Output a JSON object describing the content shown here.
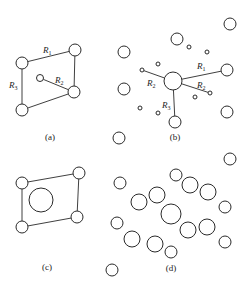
{
  "figure": {
    "width": 251,
    "height": 287,
    "stroke_color": "#2a2a2a",
    "background": "#ffffff"
  },
  "panels": {
    "a": {
      "caption": "(a)",
      "caption_pos": [
        50,
        140
      ],
      "nodes": [
        {
          "id": "a1",
          "x": 22,
          "y": 63,
          "r": 6
        },
        {
          "id": "a2",
          "x": 75,
          "y": 50,
          "r": 6
        },
        {
          "id": "a3",
          "x": 40,
          "y": 78,
          "r": 3.5
        },
        {
          "id": "a4",
          "x": 74,
          "y": 92,
          "r": 6
        },
        {
          "id": "a5",
          "x": 22,
          "y": 110,
          "r": 6
        }
      ],
      "edges": [
        [
          "a1",
          "a2"
        ],
        [
          "a2",
          "a4"
        ],
        [
          "a3",
          "a4"
        ],
        [
          "a4",
          "a5"
        ],
        [
          "a1",
          "a5"
        ]
      ],
      "labels": [
        {
          "text": "R",
          "sub": "1",
          "x": 43,
          "y": 53
        },
        {
          "text": "R",
          "sub": "2",
          "x": 55,
          "y": 83
        },
        {
          "text": "R",
          "sub": "3",
          "x": 9,
          "y": 88
        }
      ]
    },
    "b": {
      "caption": "(b)",
      "caption_pos": [
        175,
        140
      ],
      "center": {
        "id": "b0",
        "x": 173,
        "y": 81,
        "r": 9
      },
      "nodes": [
        {
          "id": "b1",
          "x": 230,
          "y": 24,
          "r": 6
        },
        {
          "id": "b2",
          "x": 177,
          "y": 39,
          "r": 6
        },
        {
          "id": "b3",
          "x": 189,
          "y": 47,
          "r": 2
        },
        {
          "id": "b4",
          "x": 207,
          "y": 52,
          "r": 2
        },
        {
          "id": "b5",
          "x": 124,
          "y": 52,
          "r": 6
        },
        {
          "id": "b6",
          "x": 158,
          "y": 64,
          "r": 2
        },
        {
          "id": "b7",
          "x": 142,
          "y": 70,
          "r": 2
        },
        {
          "id": "b8",
          "x": 227,
          "y": 70,
          "r": 6
        },
        {
          "id": "b9",
          "x": 210,
          "y": 93,
          "r": 2
        },
        {
          "id": "b10",
          "x": 195,
          "y": 97,
          "r": 2
        },
        {
          "id": "b11",
          "x": 124,
          "y": 89,
          "r": 6
        },
        {
          "id": "b12",
          "x": 140,
          "y": 108,
          "r": 2
        },
        {
          "id": "b13",
          "x": 158,
          "y": 113,
          "r": 2
        },
        {
          "id": "b14",
          "x": 175,
          "y": 122,
          "r": 6
        },
        {
          "id": "b15",
          "x": 227,
          "y": 112,
          "r": 6
        },
        {
          "id": "b16",
          "x": 119,
          "y": 138,
          "r": 6
        }
      ],
      "edges": [
        [
          "b0",
          "b7"
        ],
        [
          "b0",
          "b8"
        ],
        [
          "b0",
          "b9"
        ],
        [
          "b0",
          "b14"
        ]
      ],
      "labels": [
        {
          "text": "R",
          "sub": "1",
          "x": 197,
          "y": 69
        },
        {
          "text": "R",
          "sub": "2",
          "x": 197,
          "y": 88
        },
        {
          "text": "R",
          "sub": "2",
          "x": 147,
          "y": 86
        },
        {
          "text": "R",
          "sub": "3",
          "x": 162,
          "y": 108
        }
      ]
    },
    "c": {
      "caption": "(c)",
      "caption_pos": [
        47,
        270
      ],
      "nodes": [
        {
          "id": "c1",
          "x": 22,
          "y": 183,
          "r": 6
        },
        {
          "id": "c2",
          "x": 79,
          "y": 173,
          "r": 6
        },
        {
          "id": "c3",
          "x": 77,
          "y": 217,
          "r": 6
        },
        {
          "id": "c4",
          "x": 22,
          "y": 227,
          "r": 6
        },
        {
          "id": "c5",
          "x": 41,
          "y": 200,
          "r": 12
        }
      ],
      "edges": [
        [
          "c1",
          "c2"
        ],
        [
          "c2",
          "c3"
        ],
        [
          "c3",
          "c4"
        ],
        [
          "c4",
          "c1"
        ]
      ],
      "labels": []
    },
    "d": {
      "caption": "(d)",
      "caption_pos": [
        171,
        271
      ],
      "nodes": [
        {
          "id": "d1",
          "x": 230,
          "y": 159,
          "r": 6
        },
        {
          "id": "d2",
          "x": 176,
          "y": 175,
          "r": 6
        },
        {
          "id": "d3",
          "x": 120,
          "y": 183,
          "r": 6
        },
        {
          "id": "d4",
          "x": 190,
          "y": 185,
          "r": 8
        },
        {
          "id": "d5",
          "x": 208,
          "y": 192,
          "r": 8
        },
        {
          "id": "d6",
          "x": 157,
          "y": 195,
          "r": 8
        },
        {
          "id": "d7",
          "x": 139,
          "y": 202,
          "r": 8
        },
        {
          "id": "d8",
          "x": 225,
          "y": 207,
          "r": 6
        },
        {
          "id": "d9",
          "x": 171,
          "y": 214,
          "r": 10
        },
        {
          "id": "d10",
          "x": 117,
          "y": 223,
          "r": 6
        },
        {
          "id": "d11",
          "x": 188,
          "y": 230,
          "r": 8
        },
        {
          "id": "d12",
          "x": 207,
          "y": 227,
          "r": 8
        },
        {
          "id": "d13",
          "x": 132,
          "y": 239,
          "r": 8
        },
        {
          "id": "d14",
          "x": 155,
          "y": 244,
          "r": 8
        },
        {
          "id": "d15",
          "x": 225,
          "y": 242,
          "r": 6
        },
        {
          "id": "d16",
          "x": 171,
          "y": 252,
          "r": 6
        },
        {
          "id": "d17",
          "x": 112,
          "y": 270,
          "r": 6
        }
      ],
      "edges": [],
      "labels": []
    }
  }
}
